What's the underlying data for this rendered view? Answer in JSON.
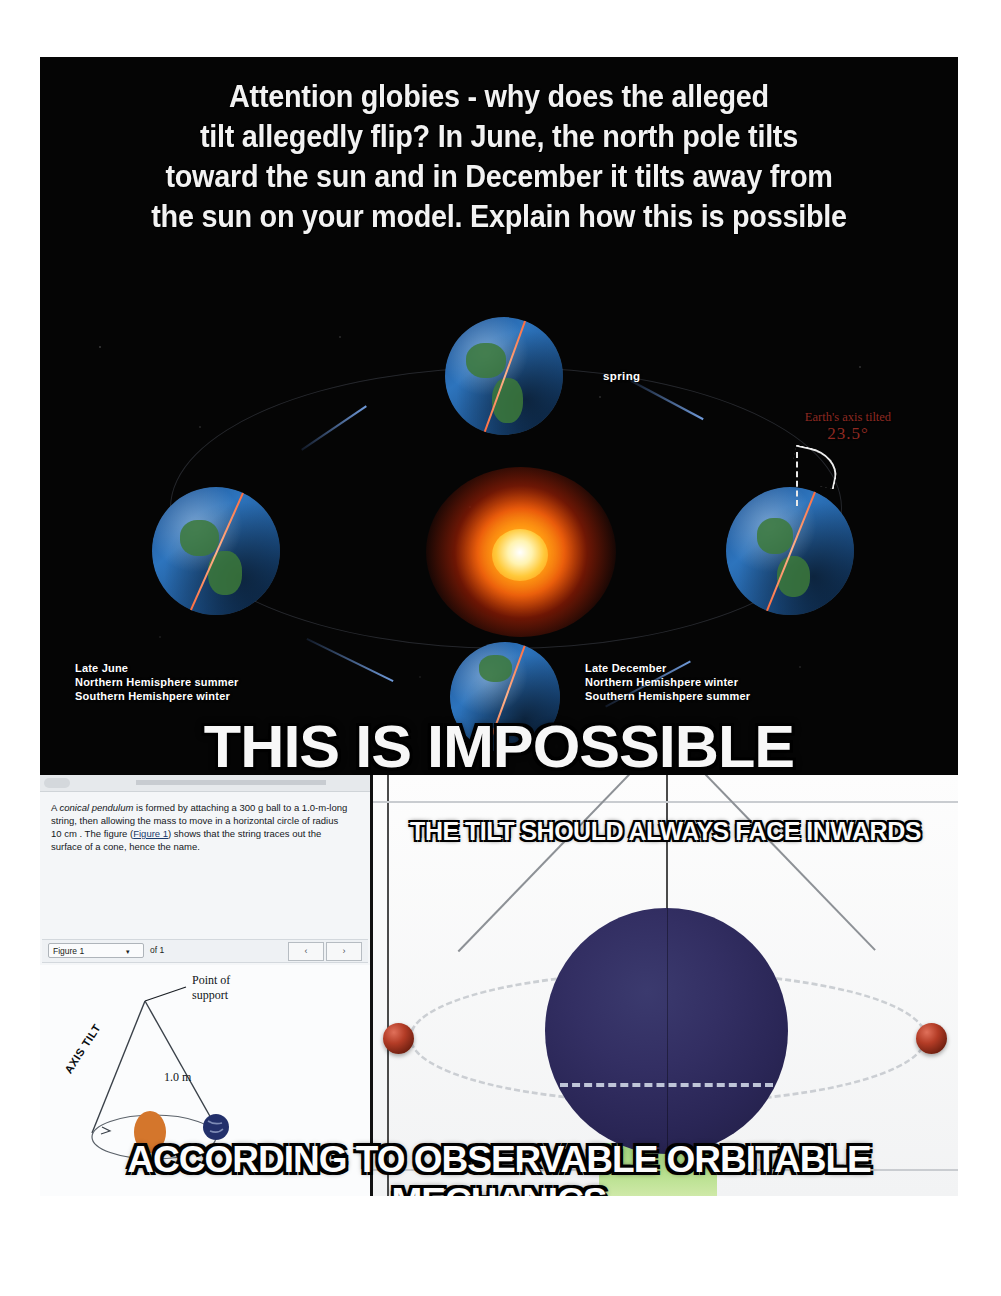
{
  "meme": {
    "headline_lines": [
      "Attention globies - why does the alleged",
      "tilt allegedly flip? In June, the north pole tilts",
      "toward the sun and in December it tilts away from",
      "the sun on your model. Explain how this is possible"
    ],
    "impossible_caption": "THIS IS IMPOSSIBLE",
    "tilt_caption": "THE TILT SHOULD ALWAYS FACE INWARDS",
    "mechanics_caption": "ACCORDING TO OBSERVABLE ORBITABLE MECHANICS"
  },
  "seasons_diagram": {
    "spring_label": "spring",
    "axis_note_line1": "Earth's axis tilted",
    "axis_note_degrees": "23.5°",
    "left_label": {
      "line1": "Late June",
      "line2": "Northern Hemisphere summer",
      "line3": "Southern Hemishpere winter"
    },
    "right_label": {
      "line1": "Late December",
      "line2": "Northern Hemishpere winter",
      "line3": "Southern Hemishpere summer"
    }
  },
  "textbook": {
    "problem_parts": {
      "p1": "A ",
      "p2_italic": "conical pendulum",
      "p3": " is formed by attaching a 300  g ball to a 1.0-m-long string, then allowing the mass to move in a horizontal circle of radius 10  cm . The figure (",
      "p4_link": "Figure 1",
      "p5": ") shows that the string traces out the surface of a cone, hence the name."
    },
    "figure_selector_value": "Figure 1",
    "figure_of_label": "of 1",
    "prev_button": "‹",
    "next_button": "›",
    "figure_labels": {
      "point_of_support": "Point of\nsupport",
      "length": "1.0 m",
      "axis_tilt": "AXIS TILT"
    }
  },
  "colors": {
    "panel_background": "#050505",
    "caption_text": "#f7f7f7",
    "tilt_note": "#8f2a22",
    "sun_core": "#ffc93a",
    "globe_photo": "#332f63",
    "pendulum_ball": "#b33c26"
  }
}
